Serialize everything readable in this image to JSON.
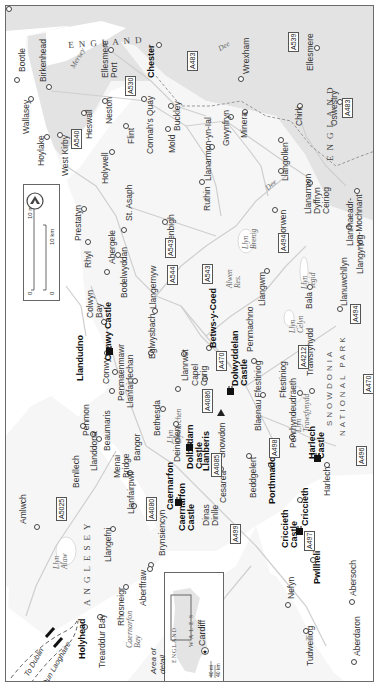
{
  "map": {
    "title": "North Wales",
    "orientation": "rotated 90 degrees counter-clockwise",
    "colors": {
      "land_wales": "#f7f7f7",
      "land_england": "#e4e4e4",
      "sea": "#ffffff",
      "roads": "#cfcfcf",
      "border": "#6b6b6b"
    },
    "regions": {
      "england_top": "ENGLAND",
      "england_right": "ENGLAND",
      "anglesey": "ANGLESEY",
      "snowdonia_1": "SNOWDONIA",
      "snowdonia_2": "NATIONAL PARK"
    },
    "water": {
      "mersey": "Mersey",
      "dee_1": "Dee",
      "dee_2": "Dee",
      "llyn_alaw": "Llyn Alaw",
      "llyn_brenig": "Llyn Brenig",
      "alwen_res": "Alwen Res.",
      "llyn_tegid": "Llyn Tegid",
      "llyn_celyn": "Llyn Celyn",
      "llyn_trawsfynydd": "Llyn Trawsfynydd",
      "llyn_dywarchen": "Llyn Dywarchen",
      "caernarfon_bay": "Caernarfon Bay"
    },
    "ferries": [
      "To Dublin",
      "To Dun Laoghaire"
    ],
    "towns": {
      "bootle": "Bootle",
      "birkenhead": "Birkenhead",
      "wallasey": "Wallasey",
      "hoylake": "Hoylake",
      "west_kirby": "West Kirby",
      "heswall": "Heswall",
      "neston": "Neston",
      "ellesmere_port": "Ellesmere Port",
      "chester": "Chester",
      "flint": "Flint",
      "connahs_quay": "Connah's Quay",
      "holywell": "Holywell",
      "mold": "Mold",
      "buckley": "Buckley",
      "wrexham": "Wrexham",
      "llanarmon_yn_ial": "Llanarmon-yn-Ial",
      "gwynfryn": "Gwynfryn",
      "minera": "Minera",
      "ellesmere": "Ellesmere",
      "chirk": "Chirk",
      "oswestry": "Oswestry",
      "llangollen": "Llangollen",
      "llanarmon_dc": "Llanarmon Dyffryn Ceiriog",
      "llanrhaeadr": "Llanrhaeadr-ym-Mochnant",
      "llangynog": "Llangynog",
      "corwen": "Corwen",
      "ruthin": "Ruthin",
      "prestatyn": "Prestatyn",
      "rhyl": "Rhyl",
      "st_asaph": "St. Asaph",
      "abergele": "Abergele",
      "bodelwyddan": "Bodelwyddan",
      "denbigh": "Denbigh",
      "colwyn_bay": "Colwyn Bay",
      "llangernyw": "Llangernyw",
      "eglwysbach": "Eglwysbach",
      "llandudno": "Llandudno",
      "conwy": "Conwy",
      "penmaenmawr": "Penmaenmawr",
      "llanfairfechan": "Llanfairfechan",
      "llanrwst": "Llanrwst",
      "capel_curig": "Capel Curig",
      "betws_y_coed": "Betws-y-Coed",
      "penmachno": "Penmachno",
      "llangwm": "Llangwm",
      "bala": "Bala",
      "llanuwchllyn": "Llanuwchllyn",
      "ffestiniog": "Ffestiniog",
      "blaenau_ffestiniog": "Blaenau Ffestiniog",
      "trawsfynydd": "Trawsfynydd",
      "penrhyndeudraeth": "Penrhyndeudraeth",
      "harlech": "Harlech",
      "beddgelert": "Beddgelert",
      "porthmadog": "Porthmadog",
      "criccieth": "Criccieth",
      "pwllheli": "Pwllheli",
      "abersoch": "Abersoch",
      "aberdaron": "Aberdaron",
      "nefyn": "Nefyn",
      "tudweiliog": "Tudweiliog",
      "snowdon": "Snowdon",
      "cesarea": "Cesarea",
      "llanberis": "Llanberis",
      "deiniolen": "Deiniolen",
      "bethesda": "Bethesda",
      "bangor": "Bangor",
      "beaumaris": "Beaumaris",
      "penmon": "Penmon",
      "menai_bridge": "Menai Bridge",
      "llanddona": "Llanddona",
      "benllech": "Benllech",
      "amlwch": "Amlwch",
      "llangefni": "Llangefni",
      "llanfairpwll": "Llanfairpwll",
      "caernarfon": "Caernarfon",
      "dinas_dinlle": "Dinas Dinlle",
      "brynsiencyn": "Brynsiencyn",
      "aberffraw": "Aberffraw",
      "rhosneigr": "Rhosneigr",
      "trearddur_bay": "Trearddur Bay",
      "holyhead": "Holyhead"
    },
    "castles": {
      "conwy": "Conwy Castle",
      "caernarfon": "Caernarfon Castle",
      "dolbadarn": "Dolbadarn Castle",
      "dolwyddelan": "Dolwyddelan Castle",
      "harlech": "Harlech Castle",
      "criccieth": "Criccieth Castle"
    },
    "roads": [
      "A540",
      "A530",
      "A483",
      "A539",
      "A483",
      "A543",
      "A544",
      "A543",
      "A494",
      "A494",
      "A470",
      "A4086",
      "A4212",
      "A470",
      "A498",
      "A4085",
      "A496",
      "A5025",
      "A4080",
      "A499",
      "A497"
    ],
    "legend": {
      "scale_mi_0": "0",
      "scale_mi_10": "10 mi",
      "scale_km_0": "0",
      "scale_km_10": "10 km",
      "compass": "north-arrow"
    },
    "inset": {
      "england": "ENGLAND",
      "wales": "WALES",
      "cardiff": "Cardiff",
      "area_label": "Area of detail",
      "scale_mi_0": "0",
      "scale_mi": "40 mi",
      "scale_km_0": "0",
      "scale_km": "40 km"
    }
  }
}
